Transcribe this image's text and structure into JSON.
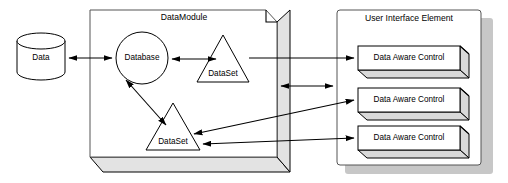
{
  "diagram": {
    "background_color": "#ffffff",
    "line_color": "#000000",
    "shadow_color": "#c7c7c7",
    "panel_fill": "#ffffff",
    "extrusion_fill": "#d9d9d9",
    "containers": [
      {
        "id": "datamodule",
        "label": "DataModule",
        "shape": "3d-panel"
      },
      {
        "id": "user-interface-element",
        "label": "User Interface Element",
        "shape": "rounded-rect-with-shadow"
      }
    ],
    "nodes": [
      {
        "id": "data-store",
        "label": "Data",
        "shape": "cylinder"
      },
      {
        "id": "database",
        "label": "Database",
        "shape": "circle"
      },
      {
        "id": "dataset-upper",
        "label": "DataSet",
        "shape": "triangle"
      },
      {
        "id": "dataset-lower",
        "label": "DataSet",
        "shape": "triangle"
      }
    ],
    "controls": [
      {
        "id": "data-aware-control-1",
        "label": "Data Aware Control"
      },
      {
        "id": "data-aware-control-2",
        "label": "Data Aware Control"
      },
      {
        "id": "data-aware-control-3",
        "label": "Data Aware Control"
      }
    ],
    "connectors": [
      {
        "id": "data-to-database",
        "from": "data-store",
        "to": "database",
        "arrows": "both"
      },
      {
        "id": "database-to-dataset-upper",
        "from": "database",
        "to": "dataset-upper",
        "arrows": "both"
      },
      {
        "id": "database-to-dataset-lower",
        "from": "database",
        "to": "dataset-lower",
        "arrows": "both"
      },
      {
        "id": "module-to-uie",
        "from": "datamodule",
        "to": "user-interface-element",
        "arrows": "both"
      },
      {
        "id": "dataset-upper-to-control-1",
        "from": "dataset-upper",
        "to": "data-aware-control-1",
        "arrows": "end"
      },
      {
        "id": "dataset-lower-to-control-2",
        "from": "dataset-lower",
        "to": "data-aware-control-2",
        "arrows": "both"
      },
      {
        "id": "dataset-lower-to-control-3",
        "from": "dataset-lower",
        "to": "data-aware-control-3",
        "arrows": "both"
      }
    ]
  }
}
